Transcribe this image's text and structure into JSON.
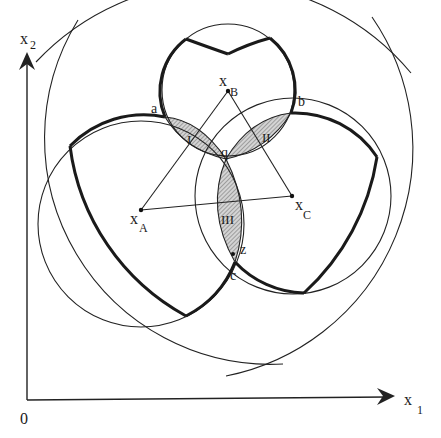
{
  "diagram": {
    "axes": {
      "x_label": "x",
      "x_sub": "1",
      "y_label": "x",
      "y_sub": "2",
      "origin_label": "0"
    },
    "centers": [
      {
        "id": "A",
        "label": "x",
        "sub": "A"
      },
      {
        "id": "B",
        "label": "x",
        "sub": "B"
      },
      {
        "id": "C",
        "label": "x",
        "sub": "C"
      }
    ],
    "points": [
      {
        "id": "a",
        "label": "a"
      },
      {
        "id": "b",
        "label": "b"
      },
      {
        "id": "q",
        "label": "q"
      },
      {
        "id": "c",
        "label": "c"
      },
      {
        "id": "z",
        "label": "z"
      }
    ],
    "regions": [
      {
        "id": "I",
        "label": "I"
      },
      {
        "id": "II",
        "label": "II"
      },
      {
        "id": "III",
        "label": "III"
      }
    ],
    "colors": {
      "line": "#222222",
      "hatch": "#555555",
      "hatch_bg": "#d8d8d8",
      "background": "#ffffff"
    }
  }
}
